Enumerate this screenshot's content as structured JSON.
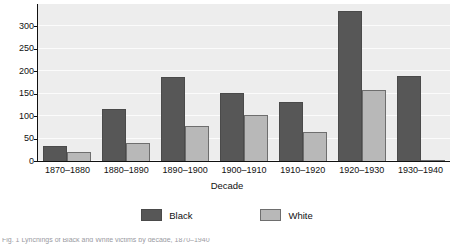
{
  "chart_data": {
    "type": "bar",
    "title": "",
    "xlabel": "Decade",
    "ylabel": "",
    "categories": [
      "1870–1880",
      "1880–1890",
      "1890–1900",
      "1900–1910",
      "1910–1920",
      "1920–1930",
      "1930–1940"
    ],
    "series": [
      {
        "name": "Black",
        "color": "#575757",
        "values": [
          33,
          115,
          187,
          152,
          132,
          335,
          190
        ]
      },
      {
        "name": "White",
        "color": "#b8b8b8",
        "values": [
          19,
          41,
          79,
          102,
          65,
          158,
          1
        ]
      }
    ],
    "ylim": [
      0,
      350
    ],
    "yticks": [
      0,
      50,
      100,
      150,
      200,
      250,
      300
    ],
    "ytick_labels": [
      "0",
      "50",
      "100",
      "150",
      "200",
      "250",
      "300"
    ],
    "gridlines": [
      0,
      50,
      100,
      150,
      200,
      250,
      300,
      350
    ],
    "grid": true,
    "legend_position": "bottom",
    "plot_background": "#ededed",
    "grid_color": "#fbfbfb"
  },
  "axes": {
    "x_title": "Decade"
  },
  "legend": {
    "entries": [
      {
        "label": "Black"
      },
      {
        "label": "White"
      }
    ]
  },
  "caption": {
    "text": "Fig. 1    Lynchings of Black and White victims by decade, 1870–1940"
  }
}
